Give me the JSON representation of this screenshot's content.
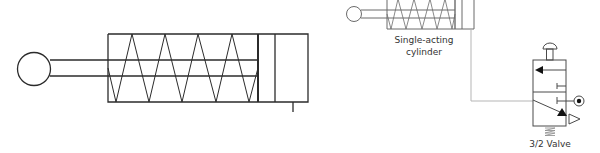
{
  "diagram": {
    "large_cylinder": {
      "type": "single-acting cylinder (spring return)"
    },
    "small_circuit": {
      "cylinder_label_line1": "Single-acting",
      "cylinder_label_line2": "cylinder",
      "valve_label": "3/2 Valve"
    },
    "colors": {
      "stroke_main": "#2b2b2b",
      "stroke_small": "#6b6b6b",
      "connector": "#b5b5b5",
      "fill": "#111111"
    }
  }
}
